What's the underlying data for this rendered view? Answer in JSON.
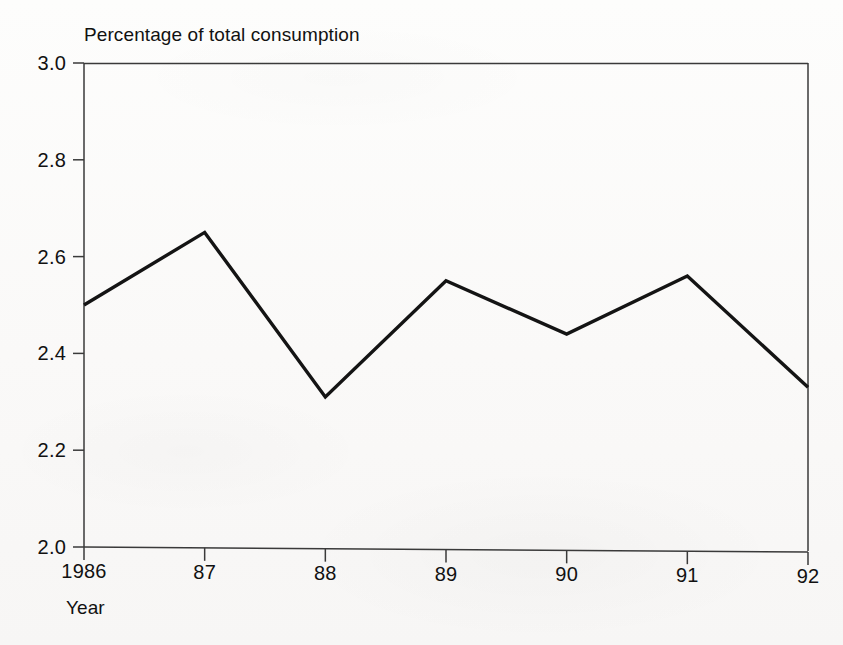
{
  "chart_data": {
    "type": "line",
    "title": "Percentage of total consumption",
    "xlabel": "Year",
    "ylabel": "",
    "categories": [
      "1986",
      "87",
      "88",
      "89",
      "90",
      "91",
      "92"
    ],
    "x": [
      1986,
      1987,
      1988,
      1989,
      1990,
      1991,
      1992
    ],
    "values": [
      2.5,
      2.65,
      2.31,
      2.55,
      2.44,
      2.56,
      2.33
    ],
    "series": [
      {
        "name": "Percentage of total consumption",
        "values": [
          2.5,
          2.65,
          2.31,
          2.55,
          2.44,
          2.56,
          2.33
        ]
      }
    ],
    "ylim": [
      2.0,
      3.0
    ],
    "ytick_labels": [
      "2.0",
      "2.2",
      "2.4",
      "2.6",
      "2.8",
      "3.0"
    ],
    "ytick_values": [
      2.0,
      2.2,
      2.4,
      2.6,
      2.8,
      3.0
    ],
    "xtick_labels": [
      "1986",
      "87",
      "88",
      "89",
      "90",
      "91",
      "92"
    ],
    "grid": false,
    "legend": "none",
    "line_color": "#141414",
    "axis_color": "#3a3a3a",
    "background_color": "#fbfbfa"
  }
}
